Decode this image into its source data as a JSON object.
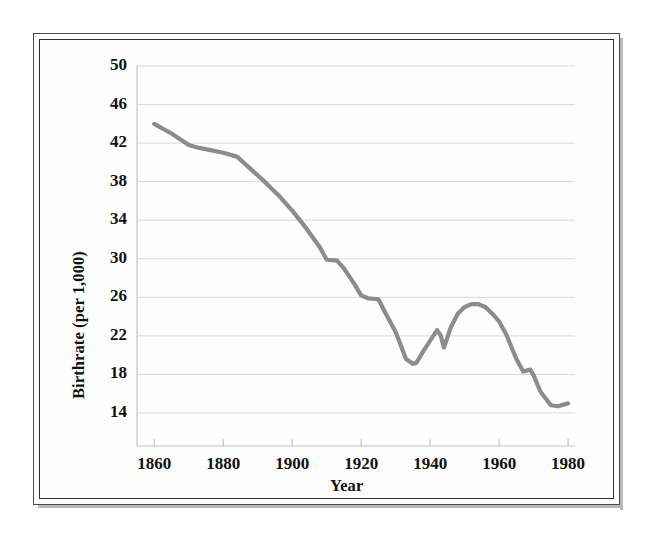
{
  "figure": {
    "background_color": "#ffffff",
    "frame_color": "#2e2e2e",
    "plot_background_color": "#fdfdfd"
  },
  "chart_data": {
    "type": "line",
    "title": "",
    "subtitle": "",
    "xlabel": "Year",
    "ylabel": "Birthrate (per 1,000)",
    "xlim": [
      1855,
      1982
    ],
    "ylim": [
      12,
      50
    ],
    "xticks": [
      1860,
      1880,
      1900,
      1920,
      1940,
      1960,
      1980
    ],
    "xtick_labels": [
      "1860",
      "1880",
      "1900",
      "1920",
      "1940",
      "1960",
      "1980"
    ],
    "yticks": [
      14,
      18,
      22,
      26,
      30,
      34,
      38,
      42,
      46,
      50
    ],
    "ytick_labels": [
      "14",
      "18",
      "22",
      "26",
      "30",
      "34",
      "38",
      "42",
      "46",
      "50"
    ],
    "grid": true,
    "grid_axis": "y",
    "grid_color": "#d9d9d9",
    "legend": false,
    "legend_position": "none",
    "series": [
      {
        "name": "Birthrate",
        "color": "#8c8c8c",
        "line_width": 4.2,
        "marker": "none",
        "x": [
          1860,
          1865,
          1870,
          1873,
          1876,
          1880,
          1884,
          1888,
          1892,
          1896,
          1900,
          1904,
          1908,
          1910,
          1913,
          1915,
          1918,
          1920,
          1922,
          1925,
          1927,
          1930,
          1933,
          1935,
          1936,
          1938,
          1940,
          1942,
          1943,
          1944,
          1946,
          1948,
          1950,
          1952,
          1954,
          1956,
          1958,
          1960,
          1962,
          1965,
          1967,
          1969,
          1970,
          1972,
          1975,
          1977,
          1980
        ],
        "y": [
          44.0,
          43.0,
          41.8,
          41.5,
          41.3,
          41.0,
          40.6,
          39.3,
          38.0,
          36.6,
          35.0,
          33.2,
          31.2,
          29.9,
          29.8,
          29.0,
          27.4,
          26.2,
          25.9,
          25.8,
          24.4,
          22.4,
          19.6,
          19.1,
          19.2,
          20.4,
          21.5,
          22.6,
          22.1,
          20.8,
          22.9,
          24.3,
          25.0,
          25.3,
          25.3,
          25.0,
          24.3,
          23.5,
          22.2,
          19.6,
          18.3,
          18.5,
          17.9,
          16.2,
          14.8,
          14.7,
          15.0
        ]
      }
    ]
  }
}
